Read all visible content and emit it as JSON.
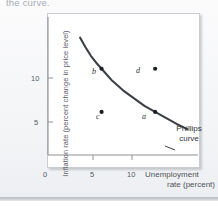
{
  "figure": {
    "caption_fragment": "the curve.",
    "background_color": "#f4f5f7",
    "frame_border_color": "#c9ccd1"
  },
  "chart_data": {
    "type": "line",
    "title": "",
    "subtitle": "",
    "xlabel_line1": "Unemployment",
    "xlabel_line2": "rate (percent)",
    "ylabel": "Inflation rate (percent change in price level)",
    "xlim": [
      0,
      14
    ],
    "ylim": [
      0,
      16
    ],
    "xticks": [
      "0",
      "5",
      "10"
    ],
    "xtick_values": [
      0,
      5,
      10
    ],
    "yticks": [
      "5",
      "10"
    ],
    "ytick_values": [
      5,
      10
    ],
    "grid": false,
    "legend_position": "none",
    "curve_color": "#3c4045",
    "point_color": "#1d2024",
    "series": [
      {
        "name": "Phillips curve",
        "type": "line",
        "annotation_line1": "Phillips",
        "annotation_line2": "curve",
        "x": [
          3.0,
          3.5,
          4.0,
          4.5,
          5.0,
          6.0,
          7.0,
          8.0,
          9.0,
          10.0,
          11.0,
          12.0,
          13.0
        ],
        "y": [
          13.6,
          12.5,
          11.5,
          10.7,
          10.0,
          8.6,
          7.5,
          6.6,
          5.7,
          5.0,
          4.3,
          3.6,
          3.0
        ]
      }
    ],
    "points": [
      {
        "label": "b",
        "x": 5,
        "y": 10,
        "on_curve": true
      },
      {
        "label": "d",
        "x": 10,
        "y": 10,
        "on_curve": false
      },
      {
        "label": "c",
        "x": 5,
        "y": 5,
        "on_curve": false
      },
      {
        "label": "a",
        "x": 10,
        "y": 5,
        "on_curve": true
      }
    ]
  }
}
